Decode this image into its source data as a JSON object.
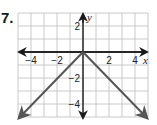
{
  "problem": {
    "number_label": "7."
  },
  "chart_data": {
    "type": "line",
    "title": "",
    "xlabel": "x",
    "ylabel": "y",
    "xlim": [
      -5,
      5
    ],
    "ylim": [
      -5,
      3
    ],
    "grid": true,
    "x_ticks_labeled": [
      -4,
      -2,
      2,
      4
    ],
    "y_ticks_labeled": [
      2,
      -2,
      -4
    ],
    "x_tick_labels": [
      "−4",
      "−2",
      "2",
      "4"
    ],
    "y_tick_labels": [
      "2",
      "−2",
      "−4"
    ],
    "series": [
      {
        "name": "y = -|x|",
        "points": [
          [
            -5,
            -5
          ],
          [
            0,
            0
          ],
          [
            5,
            -5
          ]
        ],
        "arrows_at_ends": true,
        "color": "#555555"
      }
    ],
    "colors": {
      "grid": "#bdbdbd",
      "axis": "#1a1a1a",
      "curve": "#555555"
    }
  }
}
